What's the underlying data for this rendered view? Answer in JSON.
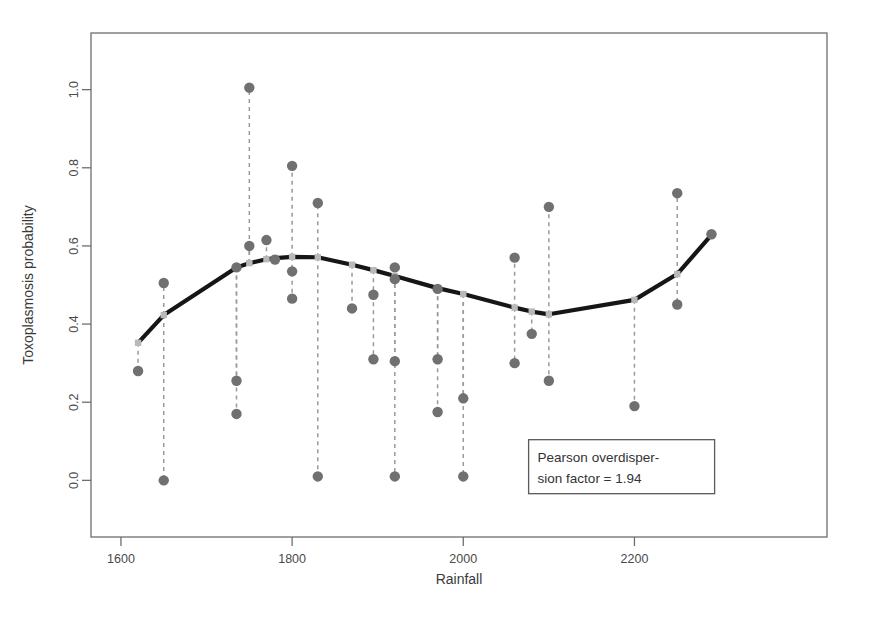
{
  "chart_data": {
    "type": "scatter",
    "title": "",
    "xlabel": "Rainfall",
    "ylabel": "Toxoplasmosis probability",
    "xlim": [
      1565,
      2425
    ],
    "ylim": [
      -0.145,
      1.145
    ],
    "xticks": [
      1600,
      1800,
      2000,
      2200
    ],
    "xticklabels": [
      "1600",
      "1800",
      "2000",
      "2200"
    ],
    "yticks": [
      0.0,
      0.2,
      0.4,
      0.6,
      0.8,
      1.0
    ],
    "yticklabels": [
      "0.0",
      "0.2",
      "0.4",
      "0.6",
      "0.8",
      "1.0"
    ],
    "grid": false,
    "legend": "none",
    "point_color": "#707070",
    "line_color": "#161616",
    "residual_line_color": "#9a9a9a",
    "frame_color": "#6e6e6e",
    "series": [
      {
        "name": "Observed toxoplasmosis probability",
        "marker": "filled-circle",
        "x": [
          1620,
          1650,
          1650,
          1735,
          1735,
          1735,
          1750,
          1750,
          1770,
          1780,
          1800,
          1800,
          1800,
          1830,
          1830,
          1870,
          1895,
          1895,
          1920,
          1920,
          1920,
          1920,
          1970,
          1970,
          1970,
          2000,
          2000,
          2060,
          2060,
          2080,
          2100,
          2100,
          2200,
          2250,
          2250,
          2290
        ],
        "y": [
          0.28,
          0.505,
          0.0,
          0.545,
          0.255,
          0.17,
          1.005,
          0.6,
          0.615,
          0.565,
          0.805,
          0.535,
          0.465,
          0.71,
          0.01,
          0.44,
          0.475,
          0.31,
          0.545,
          0.515,
          0.305,
          0.01,
          0.49,
          0.31,
          0.175,
          0.21,
          0.01,
          0.57,
          0.3,
          0.375,
          0.7,
          0.255,
          0.19,
          0.735,
          0.45,
          0.63
        ]
      },
      {
        "name": "Fitted spline",
        "marker": "none",
        "line": "solid-thick",
        "x": [
          1620,
          1650,
          1735,
          1750,
          1770,
          1780,
          1800,
          1830,
          1870,
          1895,
          1920,
          1970,
          2000,
          2060,
          2080,
          2100,
          2200,
          2250,
          2290
        ],
        "y": [
          0.352,
          0.423,
          0.545,
          0.556,
          0.566,
          0.569,
          0.572,
          0.571,
          0.552,
          0.538,
          0.523,
          0.492,
          0.477,
          0.442,
          0.432,
          0.425,
          0.462,
          0.528,
          0.628
        ]
      }
    ],
    "residual_segments": [
      {
        "x": 1620,
        "y_fit": 0.352,
        "y_obs": 0.28
      },
      {
        "x": 1650,
        "y_fit": 0.423,
        "y_obs": 0.505
      },
      {
        "x": 1650,
        "y_fit": 0.423,
        "y_obs": 0.0
      },
      {
        "x": 1735,
        "y_fit": 0.545,
        "y_obs": 0.255
      },
      {
        "x": 1735,
        "y_fit": 0.545,
        "y_obs": 0.17
      },
      {
        "x": 1750,
        "y_fit": 0.556,
        "y_obs": 1.005
      },
      {
        "x": 1750,
        "y_fit": 0.556,
        "y_obs": 0.6
      },
      {
        "x": 1770,
        "y_fit": 0.566,
        "y_obs": 0.615
      },
      {
        "x": 1780,
        "y_fit": 0.569,
        "y_obs": 0.565
      },
      {
        "x": 1800,
        "y_fit": 0.572,
        "y_obs": 0.805
      },
      {
        "x": 1800,
        "y_fit": 0.572,
        "y_obs": 0.465
      },
      {
        "x": 1830,
        "y_fit": 0.571,
        "y_obs": 0.71
      },
      {
        "x": 1830,
        "y_fit": 0.571,
        "y_obs": 0.01
      },
      {
        "x": 1870,
        "y_fit": 0.552,
        "y_obs": 0.44
      },
      {
        "x": 1895,
        "y_fit": 0.538,
        "y_obs": 0.31
      },
      {
        "x": 1920,
        "y_fit": 0.523,
        "y_obs": 0.305
      },
      {
        "x": 1920,
        "y_fit": 0.523,
        "y_obs": 0.01
      },
      {
        "x": 1970,
        "y_fit": 0.492,
        "y_obs": 0.31
      },
      {
        "x": 1970,
        "y_fit": 0.492,
        "y_obs": 0.175
      },
      {
        "x": 2000,
        "y_fit": 0.477,
        "y_obs": 0.21
      },
      {
        "x": 2000,
        "y_fit": 0.477,
        "y_obs": 0.01
      },
      {
        "x": 2060,
        "y_fit": 0.442,
        "y_obs": 0.57
      },
      {
        "x": 2060,
        "y_fit": 0.442,
        "y_obs": 0.3
      },
      {
        "x": 2080,
        "y_fit": 0.432,
        "y_obs": 0.375
      },
      {
        "x": 2100,
        "y_fit": 0.425,
        "y_obs": 0.7
      },
      {
        "x": 2100,
        "y_fit": 0.425,
        "y_obs": 0.255
      },
      {
        "x": 2200,
        "y_fit": 0.462,
        "y_obs": 0.19
      },
      {
        "x": 2250,
        "y_fit": 0.528,
        "y_obs": 0.735
      },
      {
        "x": 2250,
        "y_fit": 0.528,
        "y_obs": 0.45
      }
    ],
    "annotations": [
      {
        "name": "pearson-overdispersion-box",
        "lines": [
          "Pearson overdisper-",
          "sion factor = 1.94"
        ],
        "x": 2185,
        "y": 0.035
      }
    ]
  }
}
